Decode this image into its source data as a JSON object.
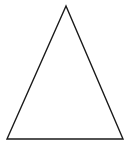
{
  "canvas": {
    "width": 130,
    "height": 149,
    "background": "#ffffff"
  },
  "shapes": [
    {
      "type": "triangle",
      "name": "triangle-outline",
      "points": [
        [
          66,
          6
        ],
        [
          7,
          139
        ],
        [
          123,
          139
        ]
      ],
      "stroke": "#1a1a1a",
      "stroke_width": 1.4,
      "fill": "none"
    }
  ]
}
